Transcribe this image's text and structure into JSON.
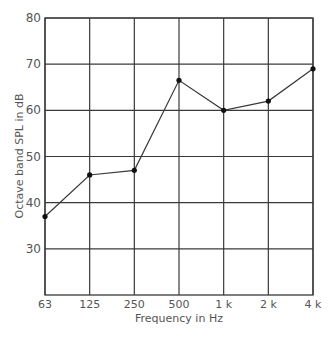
{
  "chart_data": {
    "type": "line",
    "title": "",
    "xlabel": "Frequency in Hz",
    "ylabel": "Octave band SPL in dB",
    "categories": [
      "63",
      "125",
      "250",
      "500",
      "1 k",
      "2 k",
      "4 k"
    ],
    "series": [
      {
        "name": "Octave band SPL",
        "values": [
          37,
          46,
          47,
          66.5,
          60,
          62,
          69
        ]
      }
    ],
    "yticks": [
      30,
      40,
      50,
      60,
      70,
      80
    ],
    "ylim": [
      20,
      80
    ],
    "grid": true,
    "legend": "none"
  },
  "colors": {
    "grid": "#3a3a3a",
    "line": "#3a3a3a",
    "marker": "#111111",
    "text": "#555555"
  }
}
